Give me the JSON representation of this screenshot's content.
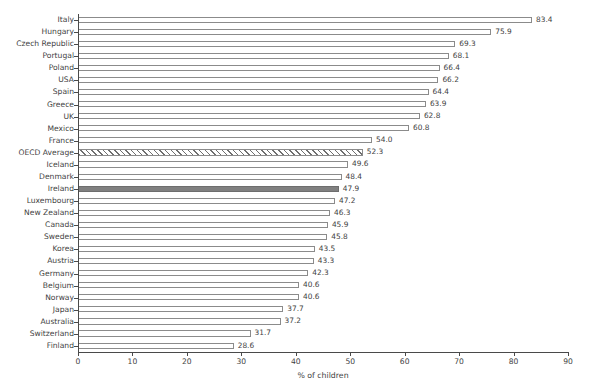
{
  "chart_data": {
    "type": "bar",
    "orientation": "horizontal",
    "title": "",
    "xlabel": "% of children",
    "ylabel": "",
    "xlim": [
      0,
      90
    ],
    "xticks": [
      0,
      10,
      20,
      30,
      40,
      50,
      60,
      70,
      80,
      90
    ],
    "grid": false,
    "legend": false,
    "categories": [
      "Italy",
      "Hungary",
      "Czech Republic",
      "Portugal",
      "Poland",
      "USA",
      "Spain",
      "Greece",
      "UK",
      "Mexico",
      "France",
      "OECD Average",
      "Iceland",
      "Denmark",
      "Ireland",
      "Luxembourg",
      "New Zealand",
      "Canada",
      "Sweden",
      "Korea",
      "Austria",
      "Germany",
      "Belgium",
      "Norway",
      "Japan",
      "Australia",
      "Switzerland",
      "Finland"
    ],
    "values": [
      83.4,
      75.9,
      69.3,
      68.1,
      66.4,
      66.2,
      64.4,
      63.9,
      62.8,
      60.8,
      54.0,
      52.3,
      49.6,
      48.4,
      47.9,
      47.2,
      46.3,
      45.9,
      45.8,
      43.5,
      43.3,
      42.3,
      40.6,
      40.6,
      37.7,
      37.2,
      31.7,
      28.6
    ],
    "value_labels": [
      "83.4",
      "75.9",
      "69.3",
      "68.1",
      "66.4",
      "66.2",
      "64.4",
      "63.9",
      "62.8",
      "60.8",
      "54.0",
      "52.3",
      "49.6",
      "48.4",
      "47.9",
      "47.2",
      "46.3",
      "45.9",
      "45.8",
      "43.5",
      "43.3",
      "42.3",
      "40.6",
      "40.6",
      "37.7",
      "37.2",
      "31.7",
      "28.6"
    ],
    "bar_styles": [
      "open",
      "open",
      "open",
      "open",
      "open",
      "open",
      "open",
      "open",
      "open",
      "open",
      "open",
      "hatched",
      "open",
      "open",
      "highlight",
      "open",
      "open",
      "open",
      "open",
      "open",
      "open",
      "open",
      "open",
      "open",
      "open",
      "open",
      "open",
      "open"
    ],
    "highlight_category": "Ireland",
    "reference_category": "OECD Average",
    "colors": {
      "bar_fill": "#ffffff",
      "bar_edge": "#8b8b8b",
      "highlight_fill": "#808080",
      "hatch_line": "#6f6f6f",
      "axis": "#4a4a4a",
      "text": "#3f3f3f",
      "background": "#ffffff"
    }
  }
}
